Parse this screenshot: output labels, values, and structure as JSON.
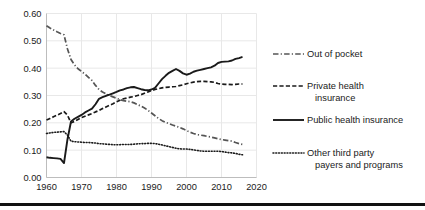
{
  "chart_data": {
    "type": "line",
    "title": "",
    "xlabel": "",
    "ylabel": "",
    "xlim": [
      1960,
      2020
    ],
    "ylim": [
      0.0,
      0.6
    ],
    "grid": true,
    "legend_position": "right",
    "x_ticks": [
      "1960",
      "1970",
      "1980",
      "1990",
      "2000",
      "2010",
      "2020"
    ],
    "x_tick_values": [
      1960,
      1970,
      1980,
      1990,
      2000,
      2010,
      2020
    ],
    "y_ticks": [
      "0.00",
      "0.10",
      "0.20",
      "0.30",
      "0.40",
      "0.50",
      "0.60"
    ],
    "y_tick_values": [
      0.0,
      0.1,
      0.2,
      0.3,
      0.4,
      0.5,
      0.6
    ],
    "series": [
      {
        "name": "Out of pocket",
        "style": "dashdot",
        "color": "#555555",
        "x": [
          1960,
          1961,
          1962,
          1963,
          1964,
          1965,
          1966,
          1967,
          1968,
          1969,
          1970,
          1971,
          1972,
          1973,
          1974,
          1975,
          1976,
          1977,
          1978,
          1979,
          1980,
          1981,
          1982,
          1983,
          1984,
          1985,
          1986,
          1987,
          1988,
          1989,
          1990,
          1991,
          1992,
          1993,
          1994,
          1995,
          1996,
          1997,
          1998,
          1999,
          2000,
          2001,
          2002,
          2003,
          2004,
          2005,
          2006,
          2007,
          2008,
          2009,
          2010,
          2011,
          2012,
          2013,
          2014,
          2015,
          2016
        ],
        "values": [
          0.555,
          0.547,
          0.54,
          0.533,
          0.527,
          0.522,
          0.47,
          0.432,
          0.412,
          0.398,
          0.388,
          0.378,
          0.366,
          0.355,
          0.337,
          0.322,
          0.313,
          0.306,
          0.3,
          0.295,
          0.29,
          0.285,
          0.281,
          0.279,
          0.277,
          0.273,
          0.267,
          0.261,
          0.254,
          0.246,
          0.236,
          0.226,
          0.216,
          0.208,
          0.202,
          0.197,
          0.192,
          0.188,
          0.183,
          0.178,
          0.172,
          0.166,
          0.161,
          0.157,
          0.155,
          0.153,
          0.15,
          0.148,
          0.145,
          0.142,
          0.139,
          0.137,
          0.135,
          0.133,
          0.128,
          0.124,
          0.121
        ]
      },
      {
        "name": "Private health insurance",
        "style": "dashed",
        "color": "#1a1a1a",
        "x": [
          1960,
          1961,
          1962,
          1963,
          1964,
          1965,
          1966,
          1967,
          1968,
          1969,
          1970,
          1971,
          1972,
          1973,
          1974,
          1975,
          1976,
          1977,
          1978,
          1979,
          1980,
          1981,
          1982,
          1983,
          1984,
          1985,
          1986,
          1987,
          1988,
          1989,
          1990,
          1991,
          1992,
          1993,
          1994,
          1995,
          1996,
          1997,
          1998,
          1999,
          2000,
          2001,
          2002,
          2003,
          2004,
          2005,
          2006,
          2007,
          2008,
          2009,
          2010,
          2011,
          2012,
          2013,
          2014,
          2015,
          2016
        ],
        "values": [
          0.21,
          0.216,
          0.222,
          0.228,
          0.234,
          0.241,
          0.228,
          0.2,
          0.205,
          0.212,
          0.219,
          0.224,
          0.229,
          0.234,
          0.24,
          0.245,
          0.252,
          0.258,
          0.264,
          0.27,
          0.277,
          0.283,
          0.288,
          0.291,
          0.294,
          0.296,
          0.3,
          0.303,
          0.308,
          0.313,
          0.318,
          0.322,
          0.325,
          0.328,
          0.33,
          0.331,
          0.332,
          0.333,
          0.336,
          0.339,
          0.343,
          0.346,
          0.349,
          0.351,
          0.352,
          0.352,
          0.351,
          0.35,
          0.348,
          0.344,
          0.342,
          0.341,
          0.341,
          0.34,
          0.341,
          0.342,
          0.342
        ]
      },
      {
        "name": "Public health insurance",
        "style": "solid",
        "color": "#1a1a1a",
        "x": [
          1960,
          1961,
          1962,
          1963,
          1964,
          1965,
          1966,
          1967,
          1968,
          1969,
          1970,
          1971,
          1972,
          1973,
          1974,
          1975,
          1976,
          1977,
          1978,
          1979,
          1980,
          1981,
          1982,
          1983,
          1984,
          1985,
          1986,
          1987,
          1988,
          1989,
          1990,
          1991,
          1992,
          1993,
          1994,
          1995,
          1996,
          1997,
          1998,
          1999,
          2000,
          2001,
          2002,
          2003,
          2004,
          2005,
          2006,
          2007,
          2008,
          2009,
          2010,
          2011,
          2012,
          2013,
          2014,
          2015,
          2016
        ],
        "values": [
          0.074,
          0.072,
          0.071,
          0.07,
          0.068,
          0.053,
          0.14,
          0.205,
          0.215,
          0.222,
          0.229,
          0.238,
          0.245,
          0.252,
          0.268,
          0.288,
          0.294,
          0.299,
          0.303,
          0.308,
          0.313,
          0.319,
          0.322,
          0.327,
          0.33,
          0.331,
          0.327,
          0.323,
          0.32,
          0.319,
          0.322,
          0.328,
          0.344,
          0.36,
          0.372,
          0.383,
          0.39,
          0.397,
          0.39,
          0.381,
          0.376,
          0.38,
          0.387,
          0.391,
          0.394,
          0.397,
          0.4,
          0.403,
          0.409,
          0.419,
          0.423,
          0.424,
          0.425,
          0.428,
          0.434,
          0.437,
          0.441
        ]
      },
      {
        "name": "Other third party payers and programs",
        "style": "dotted",
        "color": "#1a1a1a",
        "x": [
          1960,
          1961,
          1962,
          1963,
          1964,
          1965,
          1966,
          1967,
          1968,
          1969,
          1970,
          1971,
          1972,
          1973,
          1974,
          1975,
          1976,
          1977,
          1978,
          1979,
          1980,
          1981,
          1982,
          1983,
          1984,
          1985,
          1986,
          1987,
          1988,
          1989,
          1990,
          1991,
          1992,
          1993,
          1994,
          1995,
          1996,
          1997,
          1998,
          1999,
          2000,
          2001,
          2002,
          2003,
          2004,
          2005,
          2006,
          2007,
          2008,
          2009,
          2010,
          2011,
          2012,
          2013,
          2014,
          2015,
          2016
        ],
        "values": [
          0.161,
          0.163,
          0.165,
          0.166,
          0.167,
          0.168,
          0.155,
          0.133,
          0.131,
          0.13,
          0.129,
          0.128,
          0.128,
          0.127,
          0.126,
          0.124,
          0.123,
          0.122,
          0.121,
          0.12,
          0.12,
          0.12,
          0.121,
          0.121,
          0.121,
          0.122,
          0.123,
          0.124,
          0.124,
          0.125,
          0.125,
          0.124,
          0.122,
          0.119,
          0.116,
          0.113,
          0.11,
          0.107,
          0.105,
          0.104,
          0.104,
          0.103,
          0.101,
          0.099,
          0.097,
          0.096,
          0.096,
          0.096,
          0.096,
          0.096,
          0.095,
          0.093,
          0.091,
          0.09,
          0.088,
          0.085,
          0.083
        ]
      }
    ]
  },
  "legend": {
    "entries": [
      {
        "label": "Out of pocket",
        "label2": ""
      },
      {
        "label": "Private health",
        "label2": "insurance"
      },
      {
        "label": "Public health insurance",
        "label2": ""
      },
      {
        "label": "Other third party",
        "label2": "payers and programs"
      }
    ]
  },
  "colors": {
    "axis": "#1a1a1a",
    "grid": "#e8e8e8",
    "out_of_pocket": "#555555",
    "series_dark": "#1a1a1a",
    "bottom_bar": "#111111"
  }
}
